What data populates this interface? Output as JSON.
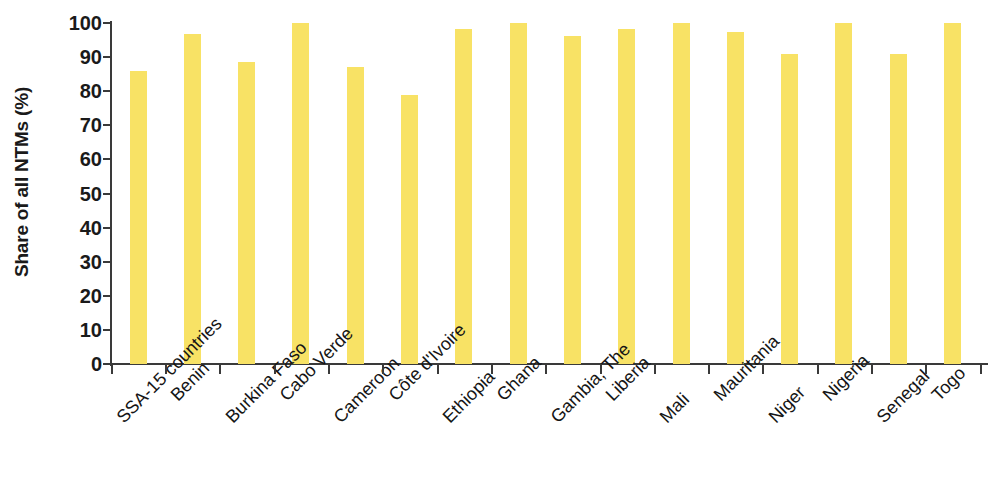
{
  "chart_data": {
    "type": "bar",
    "title": "",
    "xlabel": "",
    "ylabel": "Share of all NTMs (%)",
    "ylim": [
      0,
      100
    ],
    "ytick_labels": [
      "100",
      "90",
      "80",
      "70",
      "60",
      "50",
      "40",
      "30",
      "20",
      "10",
      "0"
    ],
    "yticks": [
      100,
      90,
      80,
      70,
      60,
      50,
      40,
      30,
      20,
      10,
      0
    ],
    "grid": false,
    "legend": null,
    "bar_color": "#f8e265",
    "axis_color": "#3a3a3a",
    "categories": [
      "SSA-15 countries",
      "Benin",
      "Burkina Faso",
      "Cabo Verde",
      "Cameroon",
      "Côte d'Ivoire",
      "Ethiopia",
      "Ghana",
      "Gambia, The",
      "Liberia",
      "Mali",
      "Mauritania",
      "Niger",
      "Nigeria",
      "Senegal",
      "Togo"
    ],
    "values": [
      86,
      96.7,
      88.6,
      100,
      87.2,
      78.8,
      98.2,
      100,
      96.1,
      98.2,
      100,
      97.3,
      91,
      100,
      91,
      100
    ]
  }
}
